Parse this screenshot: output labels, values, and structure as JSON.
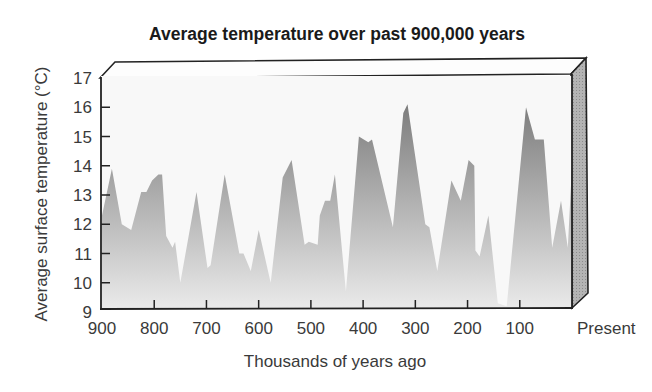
{
  "chart_data": {
    "type": "area",
    "title": "Average temperature over past 900,000 years",
    "xlabel": "Thousands of years ago",
    "ylabel": "Average surface temperature (°C)",
    "x_ticks": [
      "900",
      "800",
      "700",
      "600",
      "500",
      "400",
      "300",
      "200",
      "100",
      "Present"
    ],
    "x_tick_values": [
      900,
      800,
      700,
      600,
      500,
      400,
      300,
      200,
      100,
      0
    ],
    "y_ticks": [
      "9",
      "10",
      "11",
      "12",
      "13",
      "14",
      "15",
      "16",
      "17"
    ],
    "y_tick_values": [
      9,
      10,
      11,
      12,
      13,
      14,
      15,
      16,
      17
    ],
    "xlim": [
      900,
      0
    ],
    "ylim": [
      9,
      17
    ],
    "grid": false,
    "legend": null,
    "style": "3d-box with gray gradient area fill",
    "series": [
      {
        "name": "Average surface temperature",
        "x": [
          900,
          881,
          862,
          844,
          825,
          815,
          804,
          792,
          785,
          777,
          765,
          760,
          750,
          719,
          698,
          692,
          665,
          637,
          629,
          615,
          600,
          577,
          554,
          537,
          512,
          504,
          487,
          483,
          473,
          463,
          454,
          433,
          408,
          390,
          383,
          343,
          323,
          315,
          281,
          273,
          258,
          231,
          213,
          198,
          187,
          185,
          177,
          160,
          142,
          125,
          88,
          71,
          54,
          38,
          21,
          8,
          0
        ],
        "values": [
          12.3,
          13.9,
          12.0,
          11.8,
          13.1,
          13.1,
          13.5,
          13.7,
          13.7,
          11.6,
          11.2,
          11.4,
          10.0,
          13.1,
          10.5,
          10.6,
          13.7,
          11.0,
          11.0,
          10.4,
          11.8,
          10.0,
          13.6,
          14.2,
          11.3,
          11.4,
          11.3,
          12.3,
          12.8,
          12.8,
          13.7,
          9.7,
          15.0,
          14.8,
          14.9,
          11.9,
          15.8,
          16.1,
          12.0,
          11.9,
          10.4,
          13.5,
          12.8,
          14.2,
          14.0,
          11.1,
          10.9,
          12.3,
          9.3,
          9.2,
          16.0,
          14.9,
          14.9,
          11.2,
          12.8,
          11.2,
          14.0
        ]
      }
    ],
    "colors": {
      "fill_top": "#7a7a7a",
      "fill_bottom": "#ebebeb",
      "plot_background": "#f8f8f8",
      "side_panel": "#a8a8a8",
      "frame": "#222222"
    }
  }
}
